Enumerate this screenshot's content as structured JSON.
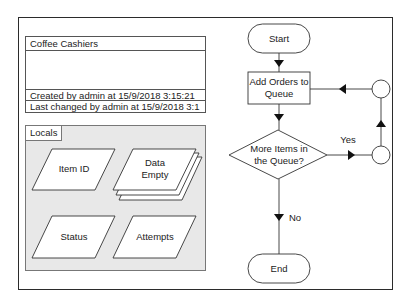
{
  "info_panel": {
    "title": "Coffee Cashiers",
    "created": "Created by admin at 15/9/2018 3:15:21",
    "last_changed": "Last changed by admin at 15/9/2018 3:1"
  },
  "locals": {
    "tab_label": "Locals",
    "items": [
      {
        "label_line1": "Item ID",
        "label_line2": "",
        "stacked": false
      },
      {
        "label_line1": "Data",
        "label_line2": "Empty",
        "stacked": true
      },
      {
        "label_line1": "Status",
        "label_line2": "",
        "stacked": false
      },
      {
        "label_line1": "Attempts",
        "label_line2": "",
        "stacked": false
      }
    ]
  },
  "flowchart": {
    "start": "Start",
    "process_line1": "Add Orders to",
    "process_line2": "Queue",
    "decision_line1": "More Items in",
    "decision_line2": "the Queue?",
    "yes_label": "Yes",
    "no_label": "No",
    "end": "End"
  },
  "colors": {
    "stroke": "#333333",
    "locals_bg": "#e8e8e8",
    "frame": "#2b2b2b"
  }
}
